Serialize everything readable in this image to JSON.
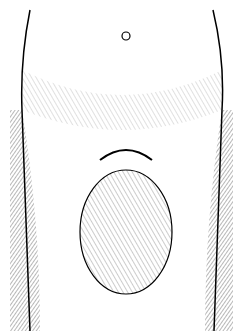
{
  "illustration": {
    "style": "black-and-white historical medical engraving",
    "subject": "anatomical plate, lower torso, frontal view",
    "ink_color": "#000000",
    "paper_color": "#ffffff"
  }
}
